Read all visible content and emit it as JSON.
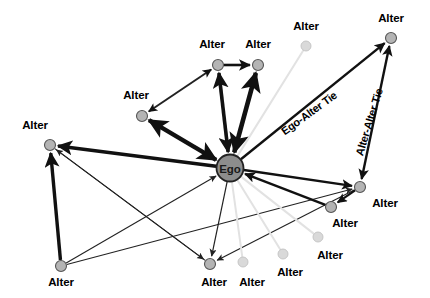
{
  "figure": {
    "type": "diagram",
    "subtype": "ego-network-sociogram",
    "background_color": "#ffffff",
    "width": 430,
    "height": 298
  },
  "palette": {
    "ego_fill": "#8d8d8d",
    "ego_stroke": "#222222",
    "alter_fill": "#b4b4b4",
    "alter_stroke": "#555555",
    "alter_faint_fill": "#d9d9d9",
    "alter_faint_stroke": "#c2c2c2",
    "edge_strong": "#111111",
    "edge_thin": "#222222",
    "edge_faint": "#e2e2e2",
    "label_color": "#000000"
  },
  "ego": {
    "id": "ego",
    "label": "Ego",
    "x": 230,
    "y": 168,
    "r": 13.5
  },
  "alters": [
    {
      "id": "a1",
      "label": "Alter",
      "x": 218,
      "y": 65,
      "r": 5.5,
      "connected": true,
      "label_x": 212,
      "label_y": 44
    },
    {
      "id": "a2",
      "label": "Alter",
      "x": 258,
      "y": 65,
      "r": 5.5,
      "connected": true,
      "label_x": 258,
      "label_y": 44
    },
    {
      "id": "a3",
      "label": "Alter",
      "x": 142,
      "y": 116,
      "r": 5.5,
      "connected": true,
      "label_x": 136,
      "label_y": 95
    },
    {
      "id": "a4",
      "label": "Alter",
      "x": 50,
      "y": 145,
      "r": 5.5,
      "connected": true,
      "label_x": 35,
      "label_y": 125
    },
    {
      "id": "a5",
      "label": "Alter",
      "x": 61,
      "y": 266,
      "r": 5.5,
      "connected": true,
      "label_x": 61,
      "label_y": 282
    },
    {
      "id": "a6",
      "label": "Alter",
      "x": 210,
      "y": 264,
      "r": 5.5,
      "connected": true,
      "label_x": 214,
      "label_y": 282
    },
    {
      "id": "a7",
      "label": "Alter",
      "x": 360,
      "y": 187,
      "r": 5.5,
      "connected": true,
      "label_x": 385,
      "label_y": 203
    },
    {
      "id": "a8",
      "label": "Alter",
      "x": 331,
      "y": 207,
      "r": 5.5,
      "connected": true,
      "label_x": 345,
      "label_y": 223
    },
    {
      "id": "a9",
      "label": "Alter",
      "x": 391,
      "y": 38,
      "r": 5.5,
      "connected": true,
      "label_x": 391,
      "label_y": 18
    },
    {
      "id": "a10",
      "label": "Alter",
      "x": 306,
      "y": 46,
      "r": 5.0,
      "connected": false,
      "label_x": 306,
      "label_y": 26
    },
    {
      "id": "a11",
      "label": "Alter",
      "x": 243,
      "y": 262,
      "r": 5.0,
      "connected": false,
      "label_x": 252,
      "label_y": 282
    },
    {
      "id": "a12",
      "label": "Alter",
      "x": 283,
      "y": 254,
      "r": 5.0,
      "connected": false,
      "label_x": 290,
      "label_y": 272
    },
    {
      "id": "a13",
      "label": "Alter",
      "x": 318,
      "y": 237,
      "r": 5.0,
      "connected": false,
      "label_x": 330,
      "label_y": 255
    }
  ],
  "edges": [
    {
      "from": "ego",
      "to": "a1",
      "kind": "ego-alter",
      "weight": "strong",
      "width": 3.6,
      "arrow": "both"
    },
    {
      "from": "a2",
      "to": "ego",
      "kind": "ego-alter",
      "weight": "strong",
      "width": 4.6,
      "arrow": "both"
    },
    {
      "from": "a1",
      "to": "a2",
      "kind": "alter-alter",
      "weight": "strong",
      "width": 2.6,
      "arrow": "forward"
    },
    {
      "from": "a3",
      "to": "ego",
      "kind": "ego-alter",
      "weight": "strong",
      "width": 4.4,
      "arrow": "both"
    },
    {
      "from": "a3",
      "to": "a1",
      "kind": "alter-alter",
      "weight": "medium",
      "width": 2.0,
      "arrow": "both"
    },
    {
      "from": "ego",
      "to": "a4",
      "kind": "ego-alter",
      "weight": "strong",
      "width": 3.4,
      "arrow": "forward"
    },
    {
      "from": "a5",
      "to": "a4",
      "kind": "alter-alter",
      "weight": "strong",
      "width": 3.4,
      "arrow": "forward"
    },
    {
      "from": "a5",
      "to": "ego",
      "kind": "ego-alter",
      "weight": "thin",
      "width": 1.1,
      "arrow": "forward"
    },
    {
      "from": "a6",
      "to": "a4",
      "kind": "alter-alter",
      "weight": "thin",
      "width": 1.1,
      "arrow": "forward"
    },
    {
      "from": "ego",
      "to": "a6",
      "kind": "ego-alter",
      "weight": "thin",
      "width": 1.2,
      "arrow": "forward"
    },
    {
      "from": "a4",
      "to": "a6",
      "kind": "alter-alter",
      "weight": "thin",
      "width": 1.1,
      "arrow": "forward"
    },
    {
      "from": "a7",
      "to": "a6",
      "kind": "alter-alter",
      "weight": "thin",
      "width": 1.1,
      "arrow": "forward"
    },
    {
      "from": "a5",
      "to": "a7",
      "kind": "alter-alter",
      "weight": "thin",
      "width": 1.1,
      "arrow": "forward"
    },
    {
      "from": "ego",
      "to": "a7",
      "kind": "ego-alter",
      "weight": "strong",
      "width": 2.4,
      "arrow": "forward"
    },
    {
      "from": "a8",
      "to": "ego",
      "kind": "ego-alter",
      "weight": "strong",
      "width": 2.4,
      "arrow": "forward"
    },
    {
      "from": "a7",
      "to": "a8",
      "kind": "alter-alter",
      "weight": "strong",
      "width": 2.2,
      "arrow": "forward"
    },
    {
      "from": "ego",
      "to": "a9",
      "kind": "ego-alter",
      "weight": "strong",
      "width": 2.4,
      "arrow": "forward"
    },
    {
      "from": "a9",
      "to": "a7",
      "kind": "alter-alter",
      "weight": "strong",
      "width": 2.4,
      "arrow": "both"
    },
    {
      "from": "ego",
      "to": "a10",
      "kind": "ego-alter",
      "weight": "faint",
      "width": 2.0,
      "arrow": "none"
    },
    {
      "from": "ego",
      "to": "a11",
      "kind": "ego-alter",
      "weight": "faint",
      "width": 2.0,
      "arrow": "none"
    },
    {
      "from": "ego",
      "to": "a12",
      "kind": "ego-alter",
      "weight": "faint",
      "width": 2.0,
      "arrow": "none"
    },
    {
      "from": "ego",
      "to": "a13",
      "kind": "ego-alter",
      "weight": "faint",
      "width": 2.0,
      "arrow": "none"
    }
  ],
  "annotations": [
    {
      "id": "ego-alter-tie",
      "text": "Ego-Alter Tie",
      "x": 309,
      "y": 113,
      "rotation": -36
    },
    {
      "id": "alter-alter-tie",
      "text": "Alter-Alter Tie",
      "x": 369,
      "y": 122,
      "rotation": -73
    }
  ]
}
